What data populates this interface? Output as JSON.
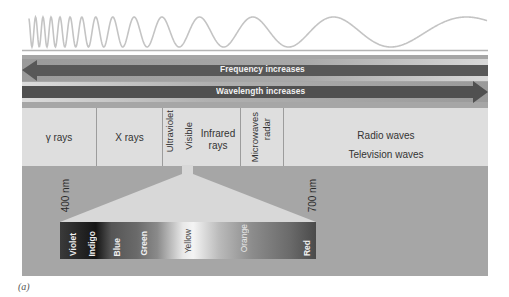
{
  "figure": {
    "caption": "(a)",
    "colors": {
      "panel": "#a6a6a6",
      "band": "#dedede",
      "arrow": "#555555",
      "wave": "#c4c4c4",
      "triangle": "#d8d8d8"
    }
  },
  "arrows": {
    "frequency": {
      "label": "Frequency increases",
      "direction": "left"
    },
    "wavelength": {
      "label": "Wavelength increases",
      "direction": "right"
    }
  },
  "regions": {
    "gamma": "γ rays",
    "xray": "X rays",
    "ultraviolet": "Ultraviolet",
    "visible": "Visible",
    "infrared_line1": "Infrared",
    "infrared_line2": "rays",
    "microwaves_line1": "Microwaves",
    "microwaves_line2": "radar",
    "radio": "Radio waves",
    "television": "Television waves"
  },
  "visible_range": {
    "start": "400 nm",
    "end": "700 nm"
  },
  "spectrum_colors": [
    {
      "label": "Violet"
    },
    {
      "label": "Indigo"
    },
    {
      "label": "Blue"
    },
    {
      "label": "Green"
    },
    {
      "label": "Yellow"
    },
    {
      "label": "Orange"
    },
    {
      "label": "Red"
    }
  ]
}
